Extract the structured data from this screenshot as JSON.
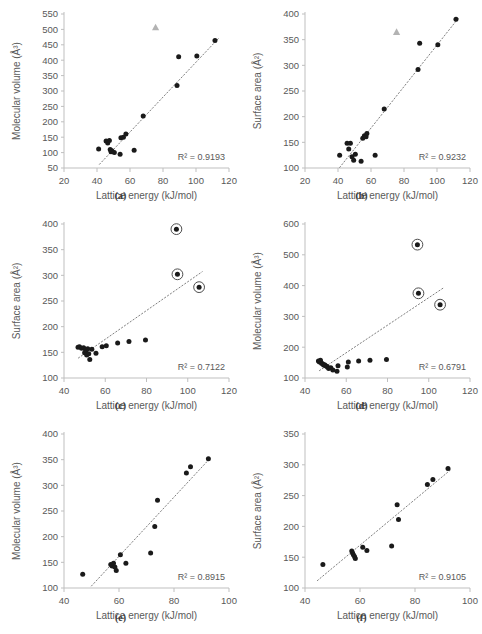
{
  "figure": {
    "title": "",
    "panel_order": [
      "a",
      "b",
      "c",
      "d",
      "e",
      "f"
    ]
  },
  "captions": {
    "a": "(a)",
    "b": "(b)",
    "c": "(c)",
    "d": "(d)",
    "e": "(e)",
    "f": "(f)"
  },
  "colors": {
    "marker": "#1a1a1a",
    "outlier_triangle": "#b3b3b3",
    "trendline": "#808080",
    "axis": "#bfbfbf",
    "text": "#595959",
    "background": "#ffffff"
  },
  "chart_data": [
    {
      "id": "a",
      "type": "scatter",
      "title": "",
      "xlabel": "Lattice energy (kJ/mol)",
      "ylabel": "Molecular volume (Å³)",
      "xlim": [
        20,
        120
      ],
      "ylim": [
        50,
        550
      ],
      "xticks": [
        20,
        40,
        60,
        80,
        100,
        120
      ],
      "yticks": [
        50,
        100,
        150,
        200,
        250,
        300,
        350,
        400,
        450,
        500,
        550
      ],
      "grid": false,
      "legend": "none",
      "r_squared_label": "R² = 0.9193",
      "r_squared": 0.9193,
      "trendline": {
        "type": "linear",
        "style": "dotted",
        "x0": 41.5,
        "y0": 62,
        "x1": 113.5,
        "y1": 470
      },
      "series": [
        {
          "name": "molecular volume",
          "marker": "filled-circle",
          "x": [
            41.0,
            45.5,
            46.5,
            47.5,
            48.0,
            48.5,
            49.0,
            50.5,
            54.0,
            54.5,
            56.0,
            57.5,
            62.5,
            68.0,
            88.5,
            89.5,
            100.5,
            111.5
          ],
          "y": [
            112,
            138,
            131,
            139,
            110,
            103,
            106,
            100,
            95,
            148,
            150,
            160,
            108,
            219,
            318,
            411,
            414,
            464
          ]
        },
        {
          "name": "outlier",
          "marker": "triangle",
          "x": [
            75.5
          ],
          "y": [
            507
          ]
        }
      ]
    },
    {
      "id": "b",
      "type": "scatter",
      "title": "",
      "xlabel": "Lattice energy (kJ/mol)",
      "ylabel": "Surface area (Å²)",
      "xlim": [
        20,
        120
      ],
      "ylim": [
        100,
        400
      ],
      "xticks": [
        20,
        40,
        60,
        80,
        100,
        120
      ],
      "yticks": [
        100,
        150,
        200,
        250,
        300,
        350,
        400
      ],
      "grid": false,
      "legend": "none",
      "r_squared_label": "R² = 0.9232",
      "r_squared": 0.9232,
      "trendline": {
        "type": "linear",
        "style": "dotted",
        "x0": 41.0,
        "y0": 101,
        "x1": 113.0,
        "y1": 392
      },
      "series": [
        {
          "name": "surface area",
          "marker": "filled-circle",
          "x": [
            41.0,
            45.5,
            46.5,
            47.5,
            48.5,
            49.5,
            50.5,
            54.0,
            55.0,
            56.0,
            57.0,
            57.5,
            62.5,
            68.0,
            88.5,
            89.5,
            100.5,
            111.5
          ],
          "y": [
            125,
            148,
            137,
            148,
            122,
            115,
            127,
            113,
            158,
            163,
            161,
            167,
            125,
            215,
            292,
            343,
            340,
            390
          ]
        },
        {
          "name": "outlier",
          "marker": "triangle",
          "x": [
            75.5
          ],
          "y": [
            365
          ]
        }
      ]
    },
    {
      "id": "c",
      "type": "scatter",
      "title": "",
      "xlabel": "Lattice energy (kJ/mol)",
      "ylabel": "Surface area (Å²)",
      "xlim": [
        40,
        120
      ],
      "ylim": [
        100,
        400
      ],
      "xticks": [
        40,
        60,
        80,
        100,
        120
      ],
      "yticks": [
        100,
        150,
        200,
        250,
        300,
        350,
        400
      ],
      "grid": false,
      "legend": "none",
      "r_squared_label": "R² = 0.7122",
      "r_squared": 0.7122,
      "trendline": {
        "type": "linear",
        "style": "dotted",
        "x0": 47.0,
        "y0": 139,
        "x1": 107.0,
        "y1": 307
      },
      "series": [
        {
          "name": "surface area",
          "marker": "filled-circle",
          "x": [
            46.8,
            47.5,
            48.5,
            49.5,
            50.0,
            50.5,
            51.0,
            51.5,
            52.0,
            52.5,
            53.5,
            55.5,
            58.5,
            60.5,
            66.0,
            71.5,
            79.5
          ],
          "y": [
            160,
            161,
            158,
            159,
            149,
            153,
            145,
            157,
            147,
            136,
            156,
            148,
            161,
            163,
            168,
            171,
            174
          ]
        },
        {
          "name": "circled outliers",
          "marker": "circled-dot",
          "x": [
            94.5,
            95.0,
            105.5
          ],
          "y": [
            390,
            302,
            277
          ]
        }
      ]
    },
    {
      "id": "d",
      "type": "scatter",
      "title": "",
      "xlabel": "Lattice energy (kJ/mol)",
      "ylabel": "Molecular volume (Å³)",
      "xlim": [
        40,
        120
      ],
      "ylim": [
        100,
        600
      ],
      "xticks": [
        40,
        60,
        80,
        100,
        120
      ],
      "yticks": [
        100,
        200,
        300,
        400,
        500,
        600
      ],
      "grid": false,
      "legend": "none",
      "r_squared_label": "R² = 0.6791",
      "r_squared": 0.6791,
      "trendline": {
        "type": "linear",
        "style": "dotted",
        "x0": 47.0,
        "y0": 124,
        "x1": 107.0,
        "y1": 392
      },
      "series": [
        {
          "name": "molecular volume",
          "marker": "filled-circle",
          "x": [
            46.5,
            47.0,
            47.5,
            48.0,
            48.5,
            49.0,
            49.5,
            50.0,
            50.5,
            51.0,
            51.5,
            52.5,
            53.5,
            55.5,
            56.0,
            60.5,
            61.0,
            66.0,
            71.5,
            79.5
          ],
          "y": [
            155,
            152,
            158,
            148,
            146,
            142,
            143,
            140,
            138,
            135,
            131,
            133,
            126,
            122,
            140,
            136,
            152,
            155,
            158,
            160
          ]
        },
        {
          "name": "circled outliers",
          "marker": "circled-dot",
          "x": [
            94.5,
            95.0,
            105.5
          ],
          "y": [
            533,
            375,
            338
          ]
        }
      ]
    },
    {
      "id": "e",
      "type": "scatter",
      "title": "",
      "xlabel": "Lattice energy (kJ/mol)",
      "ylabel": "Molecular volume (Å³)",
      "xlim": [
        40,
        100
      ],
      "ylim": [
        100,
        400
      ],
      "xticks": [
        40,
        60,
        80,
        100
      ],
      "yticks": [
        100,
        150,
        200,
        250,
        300,
        350,
        400
      ],
      "grid": false,
      "legend": "none",
      "r_squared_label": "R² = 0.8915",
      "r_squared": 0.8915,
      "trendline": {
        "type": "linear",
        "style": "dotted",
        "x0": 50.0,
        "y0": 104,
        "x1": 93.0,
        "y1": 352
      },
      "series": [
        {
          "name": "molecular volume",
          "marker": "filled-circle",
          "x": [
            46.8,
            57.0,
            57.5,
            58.0,
            58.5,
            59.0,
            60.5,
            62.5,
            71.5,
            73.0,
            74.0,
            84.5,
            86.0,
            92.5
          ],
          "y": [
            127,
            146,
            143,
            148,
            141,
            134,
            165,
            148,
            168,
            220,
            271,
            324,
            336,
            352
          ]
        }
      ]
    },
    {
      "id": "f",
      "type": "scatter",
      "title": "",
      "xlabel": "Lattice energy (kJ/mol)",
      "ylabel": "Surface area (Å²)",
      "xlim": [
        40,
        100
      ],
      "ylim": [
        100,
        350
      ],
      "xticks": [
        40,
        60,
        80,
        100
      ],
      "yticks": [
        100,
        150,
        200,
        250,
        300,
        350
      ],
      "grid": false,
      "legend": "none",
      "r_squared_label": "R² = 0.9105",
      "r_squared": 0.9105,
      "trendline": {
        "type": "linear",
        "style": "dotted",
        "x0": 44.5,
        "y0": 112,
        "x1": 93.0,
        "y1": 292
      },
      "series": [
        {
          "name": "surface area",
          "marker": "filled-circle",
          "x": [
            46.5,
            57.0,
            57.3,
            57.6,
            58.0,
            58.3,
            61.0,
            62.5,
            71.5,
            73.5,
            74.0,
            84.5,
            86.5,
            92.0
          ],
          "y": [
            138,
            160,
            157,
            154,
            151,
            148,
            166,
            161,
            168,
            235,
            211,
            268,
            276,
            294
          ]
        }
      ]
    }
  ]
}
